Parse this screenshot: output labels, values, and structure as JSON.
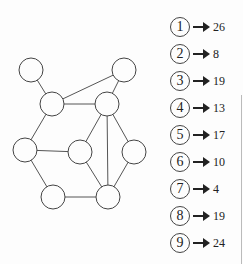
{
  "diagram": {
    "type": "graph",
    "nodes": [
      {
        "id": "a",
        "x": 31,
        "y": 70
      },
      {
        "id": "b",
        "x": 124,
        "y": 70
      },
      {
        "id": "c",
        "x": 52,
        "y": 104
      },
      {
        "id": "d",
        "x": 107,
        "y": 104
      },
      {
        "id": "e",
        "x": 25,
        "y": 150
      },
      {
        "id": "f",
        "x": 80,
        "y": 152
      },
      {
        "id": "g",
        "x": 134,
        "y": 152
      },
      {
        "id": "h",
        "x": 53,
        "y": 197
      },
      {
        "id": "i",
        "x": 108,
        "y": 197
      }
    ],
    "edges": [
      [
        "a",
        "c"
      ],
      [
        "c",
        "b"
      ],
      [
        "b",
        "d"
      ],
      [
        "c",
        "d"
      ],
      [
        "c",
        "e"
      ],
      [
        "e",
        "f"
      ],
      [
        "d",
        "f"
      ],
      [
        "d",
        "i"
      ],
      [
        "d",
        "g"
      ],
      [
        "e",
        "h"
      ],
      [
        "h",
        "i"
      ],
      [
        "f",
        "i"
      ],
      [
        "g",
        "i"
      ]
    ],
    "node_radius": 12
  },
  "legend": [
    {
      "label": "1",
      "value": "26"
    },
    {
      "label": "2",
      "value": "8"
    },
    {
      "label": "3",
      "value": "19"
    },
    {
      "label": "4",
      "value": "13"
    },
    {
      "label": "5",
      "value": "17"
    },
    {
      "label": "6",
      "value": "10"
    },
    {
      "label": "7",
      "value": "4"
    },
    {
      "label": "8",
      "value": "19"
    },
    {
      "label": "9",
      "value": "24"
    }
  ]
}
